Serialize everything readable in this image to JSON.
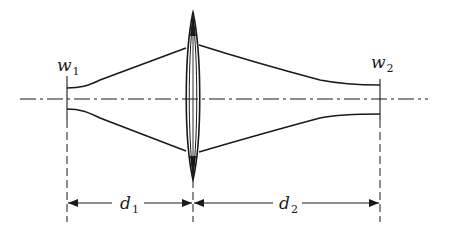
{
  "diagram": {
    "labels": {
      "w1": {
        "main": "w",
        "sub": "1"
      },
      "w2": {
        "main": "w",
        "sub": "2"
      },
      "d1": {
        "main": "d",
        "sub": "1"
      },
      "d2": {
        "main": "d",
        "sub": "2"
      }
    },
    "elements": [
      {
        "id": "optical-axis",
        "type": "dash-dot line"
      },
      {
        "id": "input-waist",
        "label": "w1",
        "type": "beam waist"
      },
      {
        "id": "thin-lens",
        "type": "biconvex lens"
      },
      {
        "id": "output-waist",
        "label": "w2",
        "type": "beam waist"
      },
      {
        "id": "distance-d1",
        "label": "d1",
        "from": "input-waist",
        "to": "thin-lens"
      },
      {
        "id": "distance-d2",
        "label": "d2",
        "from": "thin-lens",
        "to": "output-waist"
      }
    ],
    "colors": {
      "stroke": "#1a1a1a",
      "background": "#ffffff"
    }
  }
}
